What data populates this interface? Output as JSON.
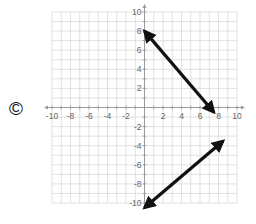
{
  "option_label": "©",
  "chart_data": {
    "type": "line",
    "title": "",
    "xlabel": "",
    "ylabel": "",
    "xlim": [
      -10,
      10
    ],
    "ylim": [
      -10,
      10
    ],
    "grid": true,
    "grid_step": 1,
    "x_ticks": [
      -10,
      -8,
      -6,
      -4,
      -2,
      2,
      4,
      6,
      8,
      10
    ],
    "y_ticks": [
      10,
      8,
      6,
      4,
      2,
      -2,
      -4,
      -6,
      -8,
      -10
    ],
    "series": [
      {
        "name": "upper-line",
        "style": "double-arrow",
        "points": [
          [
            0,
            8
          ],
          [
            7.5,
            -0.5
          ]
        ]
      },
      {
        "name": "lower-line",
        "style": "double-arrow",
        "points": [
          [
            0,
            -10.5
          ],
          [
            8.5,
            -3.5
          ]
        ]
      }
    ]
  },
  "colors": {
    "grid": "#d9d9d9",
    "axis": "#9a9a9a",
    "line": "#111111",
    "label": "#666666"
  }
}
